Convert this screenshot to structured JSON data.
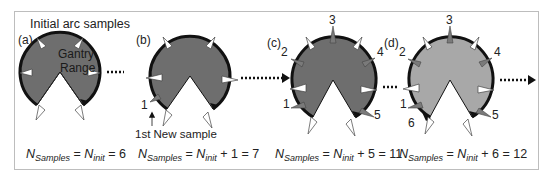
{
  "figure": {
    "title": "Initial arc samples",
    "center_label_line1": "Gantry",
    "center_label_line2": "Range",
    "new_sample_caption": "1st New sample",
    "colors": {
      "fill_a_b_c": "#6e6e6e",
      "fill_d": "#a8a8a8",
      "outline": "#111111",
      "initial_sample_marker": "#ffffff",
      "new_sample_marker": "#7a7a7a",
      "frame": "#bdbdbd"
    },
    "panels": [
      {
        "label": "(a)",
        "eq_n": "N",
        "eq_sub": "Samples",
        "eq_mid": " = ",
        "eq_n2": "N",
        "eq_sub2": "init",
        "eq_rest": " = 6",
        "new_sample_labels": []
      },
      {
        "label": "(b)",
        "eq_n": "N",
        "eq_sub": "Samples",
        "eq_mid": " = ",
        "eq_n2": "N",
        "eq_sub2": "init",
        "eq_rest": " + 1 = 7",
        "new_sample_labels": [
          "1"
        ]
      },
      {
        "label": "(c)",
        "eq_n": "N",
        "eq_sub": "Samples",
        "eq_mid": " = ",
        "eq_n2": "N",
        "eq_sub2": "init",
        "eq_rest": " + 5 = 11",
        "new_sample_labels": [
          "1",
          "2",
          "3",
          "4",
          "5"
        ]
      },
      {
        "label": "(d)",
        "eq_n": "N",
        "eq_sub": "Samples",
        "eq_mid": " = ",
        "eq_n2": "N",
        "eq_sub2": "init",
        "eq_rest": " + 6 = 12",
        "new_sample_labels": [
          "1",
          "2",
          "3",
          "4",
          "5",
          "6"
        ]
      }
    ]
  }
}
